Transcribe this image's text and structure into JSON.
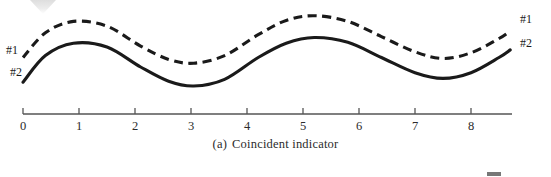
{
  "figure": {
    "caption_index": "(a)",
    "caption_text": "Coincident indicator",
    "background_color": "#ffffff",
    "ink_color": "#1a1a1a",
    "axis_color": "#555555"
  },
  "labels": {
    "left_upper": "#1",
    "left_lower": "#2",
    "right_upper": "#1",
    "right_lower": "#2"
  },
  "chart_data": {
    "type": "line",
    "xlabel": "",
    "ylabel": "",
    "xlim": [
      0,
      8.7
    ],
    "ylim": [
      0,
      1
    ],
    "grid": false,
    "legend_position": "inline-end-labels",
    "xticks": [
      0,
      1,
      2,
      3,
      4,
      5,
      6,
      7,
      8
    ],
    "xtick_labels": [
      "0",
      "1",
      "2",
      "3",
      "4",
      "5",
      "6",
      "7",
      "8"
    ],
    "yticks": [],
    "ytick_labels": [],
    "annotations": [
      {
        "text": "#1",
        "target_series": "#1",
        "side": "left"
      },
      {
        "text": "#2",
        "target_series": "#2",
        "side": "left"
      },
      {
        "text": "#1",
        "target_series": "#1",
        "side": "right"
      },
      {
        "text": "#2",
        "target_series": "#2",
        "side": "right"
      }
    ],
    "x": [
      0,
      0.4,
      0.9,
      1.5,
      2.1,
      2.6,
      3.05,
      3.6,
      4.2,
      4.7,
      5.2,
      5.8,
      6.4,
      7.0,
      7.5,
      8.0,
      8.5,
      8.7
    ],
    "series": [
      {
        "name": "#1",
        "style": "dashed",
        "color": "#1a1a1a",
        "values": [
          0.5,
          0.76,
          0.88,
          0.83,
          0.62,
          0.48,
          0.44,
          0.52,
          0.74,
          0.89,
          0.94,
          0.88,
          0.72,
          0.56,
          0.49,
          0.55,
          0.7,
          0.78
        ]
      },
      {
        "name": "#2",
        "style": "solid",
        "color": "#1a1a1a",
        "values": [
          0.24,
          0.52,
          0.65,
          0.61,
          0.4,
          0.25,
          0.2,
          0.27,
          0.5,
          0.65,
          0.71,
          0.66,
          0.5,
          0.34,
          0.28,
          0.34,
          0.5,
          0.58
        ]
      }
    ]
  },
  "axis": {
    "start_x_px": 23,
    "end_x_px": 512,
    "baseline_y_px": 114,
    "unit_px": 56,
    "tick_length_px": 6,
    "tick_direction": "up"
  }
}
